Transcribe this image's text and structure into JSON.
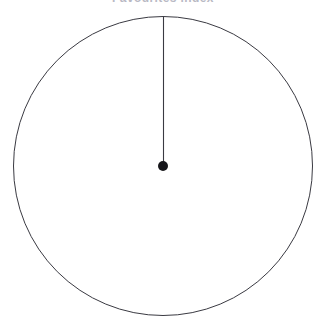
{
  "figure": {
    "title": "Favourites index",
    "title_visibility": "clipped-at-top-edge",
    "background_color": "#ffffff",
    "stroke_color": "#3a3a42",
    "center_dot_color": "#16161a",
    "title_color": "#b9b9c4"
  },
  "chart_data": {
    "type": "scatter",
    "title": "Favourites index",
    "xlabel": "",
    "ylabel": "",
    "grid": false,
    "legend_position": "none",
    "annotations": [
      "circle outline centered at (163, 166) with radius 150 px",
      "single radius line drawn from centre to the 12 o'clock position",
      "filled dot marks the centre of the circle"
    ],
    "geometry": {
      "circle": {
        "center_x": 163,
        "center_y": 166,
        "radius": 150,
        "fill": "none",
        "stroke_width": 1
      },
      "center_dot": {
        "x": 163,
        "y": 166,
        "diameter": 10
      },
      "radius_line": {
        "from_x": 163,
        "from_y": 166,
        "to_x": 164,
        "to_y": 17,
        "angle_degrees": 0,
        "clock_position": "12",
        "stroke_width": 1
      }
    },
    "x": [
      163
    ],
    "values": [
      166
    ],
    "xlim": [
      0,
      326
    ],
    "ylim": [
      0,
      332
    ]
  }
}
